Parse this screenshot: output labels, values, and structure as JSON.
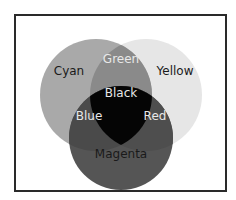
{
  "diagram": {
    "type": "venn",
    "circles": [
      {
        "name": "Cyan",
        "color": "#a9a9a9"
      },
      {
        "name": "Yellow",
        "color": "#e6e6e6"
      },
      {
        "name": "Magenta",
        "color": "#555555"
      }
    ],
    "labels": {
      "cyan": "Cyan",
      "yellow": "Yellow",
      "magenta": "Magenta",
      "green": "Green",
      "blue": "Blue",
      "red": "Red",
      "black": "Black"
    },
    "colors": {
      "green_overlap": "#8a8a8a",
      "blue_overlap": "#4a4a4a",
      "red_overlap": "#4e4e4e",
      "black_center": "#050505",
      "frame": "#2a2a2a"
    }
  }
}
